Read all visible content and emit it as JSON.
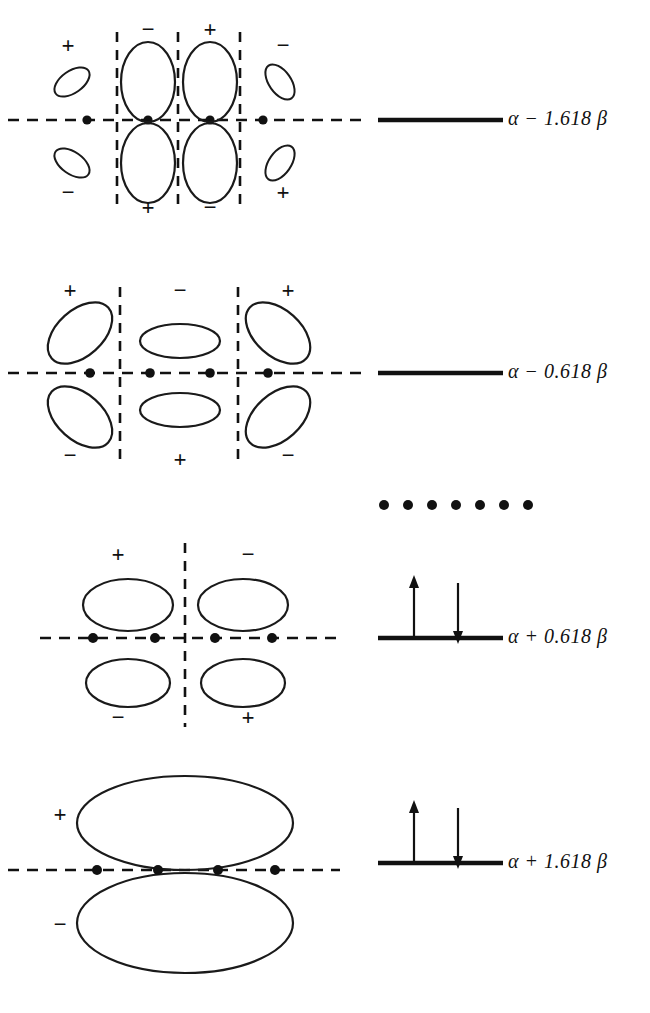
{
  "figure": {
    "ink_color": "#111111",
    "background_color": "#ffffff",
    "atom_count": 4
  },
  "levels": [
    {
      "id": "psi4",
      "energy_label": "α − 1.618 β",
      "alpha": "α",
      "operator": "−",
      "coefficient": "1.618",
      "beta": "β",
      "electrons": 0,
      "spin_arrows": [],
      "nodes": 3,
      "signs_top": [
        "+",
        "−",
        "+",
        "−"
      ],
      "signs_bottom": [
        "−",
        "+",
        "−",
        "+"
      ],
      "lobe_sizes": [
        "small",
        "large",
        "large",
        "small"
      ]
    },
    {
      "id": "psi3",
      "energy_label": "α − 0.618 β",
      "alpha": "α",
      "operator": "−",
      "coefficient": "0.618",
      "beta": "β",
      "electrons": 0,
      "spin_arrows": [],
      "nodes": 2,
      "signs_top": [
        "+",
        "−",
        "+"
      ],
      "signs_bottom": [
        "−",
        "+",
        "−"
      ],
      "lobe_sizes": [
        "large",
        "medium",
        "large"
      ]
    },
    {
      "id": "psi2",
      "energy_label": "α + 0.618 β",
      "alpha": "α",
      "operator": "+",
      "coefficient": "0.618",
      "beta": "β",
      "electrons": 2,
      "spin_arrows": [
        "up",
        "down"
      ],
      "nodes": 1,
      "signs_top": [
        "+",
        "−"
      ],
      "signs_bottom": [
        "−",
        "+"
      ],
      "lobe_sizes": [
        "large",
        "large"
      ]
    },
    {
      "id": "psi1",
      "energy_label": "α + 1.618 β",
      "alpha": "α",
      "operator": "+",
      "coefficient": "1.618",
      "beta": "β",
      "electrons": 2,
      "spin_arrows": [
        "up",
        "down"
      ],
      "nodes": 0,
      "signs_top": [
        "+"
      ],
      "signs_bottom": [
        "−"
      ],
      "lobe_sizes": [
        "extra-large"
      ]
    }
  ],
  "reference_row": {
    "id": "nonbonding-reference",
    "dot_count": 7,
    "description": "dotted reference line"
  }
}
